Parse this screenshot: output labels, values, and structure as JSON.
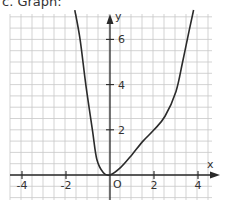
{
  "title": "c. Graph:",
  "chart_data": {
    "type": "line",
    "title": "c. Graph:",
    "xlabel": "x",
    "ylabel": "y",
    "xlim": [
      -4.5,
      4.6
    ],
    "ylim": [
      -1,
      7.2
    ],
    "grid": true,
    "grid_step": 0.5,
    "x_ticks": [
      -4,
      -2,
      2,
      4
    ],
    "y_ticks": [
      2,
      4,
      6
    ],
    "x_tick_labels": [
      "-4",
      "-2",
      "2",
      "4"
    ],
    "y_tick_labels": [
      "2",
      "4",
      "6"
    ],
    "origin_label": "O",
    "series": [
      {
        "name": "f(x)",
        "x": [
          -1.6,
          -1.36,
          -1.1,
          -0.8,
          -0.6,
          -0.3,
          0,
          0.5,
          1,
          1.5,
          2,
          2.5,
          3,
          3.3,
          3.6,
          3.8
        ],
        "y": [
          7.3,
          6,
          4,
          2,
          0.7,
          0.1,
          0,
          0.35,
          0.9,
          1.5,
          2,
          2.6,
          3.7,
          5,
          6.4,
          7.3
        ]
      }
    ]
  }
}
